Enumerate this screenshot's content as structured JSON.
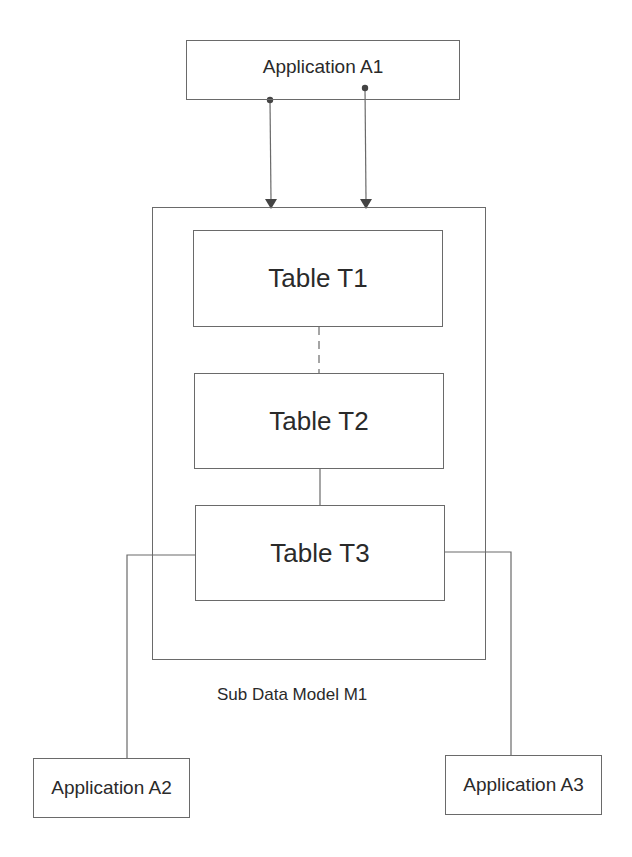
{
  "diagram": {
    "application_a1": {
      "label": "Application A1"
    },
    "application_a2": {
      "label": "Application A2"
    },
    "application_a3": {
      "label": "Application A3"
    },
    "sub_model": {
      "label": "Sub Data Model M1",
      "tables": [
        {
          "label": "Table T1"
        },
        {
          "label": "Table T2"
        },
        {
          "label": "Table T3"
        }
      ]
    },
    "connections": [
      {
        "from": "Application A1",
        "to": "Sub Data Model M1",
        "type": "arrow"
      },
      {
        "from": "Application A1",
        "to": "Sub Data Model M1",
        "type": "arrow"
      },
      {
        "from": "Table T1",
        "to": "Table T2",
        "type": "line"
      },
      {
        "from": "Table T2",
        "to": "Table T3",
        "type": "line"
      },
      {
        "from": "Table T3",
        "to": "Application A2",
        "type": "line"
      },
      {
        "from": "Table T3",
        "to": "Application A3",
        "type": "line"
      }
    ],
    "caption": "Fig. — (cut off)"
  },
  "colors": {
    "line": "#6a6a6a",
    "text": "#2a2a2a"
  }
}
